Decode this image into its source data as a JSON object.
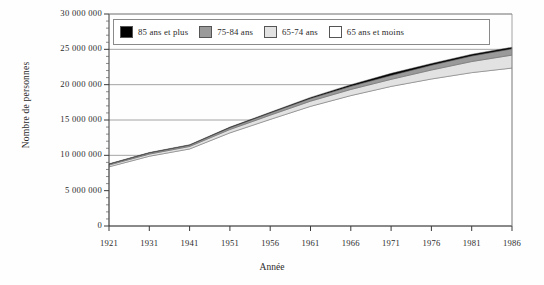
{
  "chart_data": {
    "type": "area",
    "title": "",
    "subtitle": "",
    "xlabel": "Année",
    "ylabel": "Nombre de personnes",
    "stacked": true,
    "grid": true,
    "legend_position": "top",
    "categories": [
      "1921",
      "1931",
      "1941",
      "1951",
      "1956",
      "1961",
      "1966",
      "1971",
      "1976",
      "1981",
      "1986"
    ],
    "x": [
      1921,
      1931,
      1941,
      1951,
      1956,
      1961,
      1966,
      1971,
      1976,
      1981,
      1986
    ],
    "xlim": [
      1921,
      1986
    ],
    "ylim": [
      0,
      30000000
    ],
    "ytick_values": [
      0,
      5000000,
      10000000,
      15000000,
      20000000,
      25000000,
      30000000
    ],
    "ytick_labels": [
      "0",
      "5 000 000",
      "10 000 000",
      "15 000 000",
      "20 000 000",
      "25 000 000",
      "30 000 000"
    ],
    "series": [
      {
        "name": "65 ans et moins",
        "color": "#ffffff",
        "values": [
          8370000,
          9870000,
          10900000,
          13180000,
          15080000,
          16930000,
          18450000,
          19750000,
          20800000,
          21700000,
          22350000
        ]
      },
      {
        "name": "65-74 ans",
        "color": "#e2e2e2",
        "values": [
          250000,
          300000,
          350000,
          470000,
          600000,
          730000,
          870000,
          1000000,
          1270000,
          1570000,
          1830000
        ]
      },
      {
        "name": "75-84 ans",
        "color": "#9a9a9a",
        "values": [
          130000,
          170000,
          190000,
          250000,
          310000,
          380000,
          450000,
          560000,
          680000,
          790000,
          890000
        ]
      },
      {
        "name": "85 ans et plus",
        "color": "#000000",
        "values": [
          50000,
          60000,
          60000,
          100000,
          110000,
          160000,
          230000,
          290000,
          250000,
          240000,
          230000
        ]
      }
    ],
    "totals": [
      8800000,
      10400000,
      11500000,
      14000000,
      16100000,
      18200000,
      20000000,
      21600000,
      23000000,
      24300000,
      25300000
    ]
  },
  "legend": {
    "items": [
      {
        "label": "85 ans et plus",
        "color": "#000000"
      },
      {
        "label": "75-84 ans",
        "color": "#9a9a9a"
      },
      {
        "label": "65-74 ans",
        "color": "#e2e2e2"
      },
      {
        "label": "65 ans et moins",
        "color": "#ffffff"
      }
    ]
  }
}
